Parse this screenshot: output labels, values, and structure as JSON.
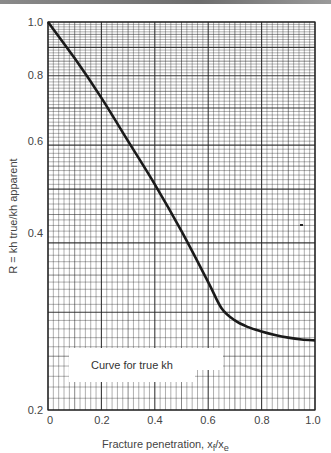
{
  "chart_data": {
    "type": "line",
    "title": "",
    "xlabel": "Fracture penetration, x_f/x_e",
    "xlabel_main": "Fracture penetration, x",
    "xlabel_sub1": "f",
    "xlabel_mid": "/x",
    "xlabel_sub2": "e",
    "ylabel": "R = kh true/kh apparent",
    "xscale": "linear",
    "yscale": "log",
    "xlim": [
      0,
      1.0
    ],
    "ylim": [
      0.2,
      1.0
    ],
    "x_ticks": [
      "0",
      "0.2",
      "0.4",
      "0.6",
      "0.8",
      "1.0"
    ],
    "y_ticks": [
      "0.2",
      "0.4",
      "0.6",
      "0.8",
      "1.0"
    ],
    "grid": true,
    "series": [
      {
        "name": "Curve for true kh",
        "x": [
          0.0,
          0.1,
          0.2,
          0.3,
          0.4,
          0.5,
          0.6,
          0.65,
          0.7,
          0.75,
          0.8,
          0.85,
          0.9,
          0.95,
          1.0
        ],
        "y": [
          1.0,
          0.86,
          0.73,
          0.61,
          0.51,
          0.42,
          0.34,
          0.305,
          0.29,
          0.282,
          0.277,
          0.273,
          0.27,
          0.268,
          0.267
        ]
      }
    ],
    "legend": {
      "entries": [
        "Curve for true kh"
      ],
      "position": "lower-left inside plot"
    }
  },
  "legend_label": "Curve for true kh",
  "axes": {
    "x_ticks": [
      "0",
      "0.2",
      "0.4",
      "0.6",
      "0.8",
      "1.0"
    ],
    "y_ticks": [
      "0.2",
      "0.4",
      "0.6",
      "0.8",
      "1.0"
    ],
    "ylabel": "R = kh true/kh apparent",
    "xlabel_main": "Fracture penetration, x",
    "xlabel_sub1": "f",
    "xlabel_mid": "/x",
    "xlabel_sub2": "e"
  },
  "colors": {
    "grid": "#222222",
    "curve": "#1a1a1a",
    "text": "#444444",
    "background": "#ffffff"
  }
}
